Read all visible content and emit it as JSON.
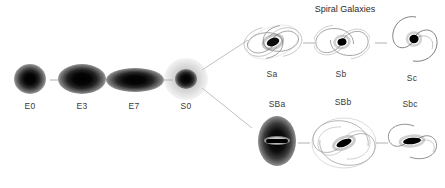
{
  "diagram": {
    "name": "Hubble Tuning Fork Diagram",
    "background_color": "#ffffff",
    "width": 445,
    "height": 188,
    "line_color": "#b4b4b4",
    "label_color": "#3a3a3a",
    "galaxy_color": "#000000"
  },
  "titles": {
    "spiral_branch": "Spiral Galaxies"
  },
  "ellipticals": {
    "sequence_label": "Elliptical sequence",
    "items": [
      {
        "label": "E0",
        "cx": 30,
        "cy": 79,
        "rx": 16,
        "ry": 15
      },
      {
        "label": "E3",
        "cx": 82,
        "cy": 79,
        "rx": 24,
        "ry": 15
      },
      {
        "label": "E7",
        "cx": 134,
        "cy": 80,
        "rx": 28,
        "ry": 12
      },
      {
        "label": "S0",
        "cx": 186,
        "cy": 78,
        "rx": 20,
        "ry": 19
      }
    ]
  },
  "spiral_branch": {
    "items": [
      {
        "label": "Sa",
        "cx": 272,
        "cy": 42
      },
      {
        "label": "Sb",
        "cx": 341,
        "cy": 42
      },
      {
        "label": "Sc",
        "cx": 412,
        "cy": 40
      }
    ]
  },
  "barred_branch": {
    "items": [
      {
        "label": "SBa",
        "cx": 277,
        "cy": 141
      },
      {
        "label": "SBb",
        "cx": 343,
        "cy": 143
      },
      {
        "label": "Sbc",
        "cx": 410,
        "cy": 139
      }
    ]
  },
  "connectors": {
    "fork_upper": "S0 to Sa branch line",
    "fork_lower": "S0 to SBa branch line",
    "dashes": [
      "E0-E3",
      "E3-E7",
      "E7-S0",
      "Sa-Sb",
      "Sb-Sc",
      "SBa-SBb",
      "SBb-Sbc"
    ]
  }
}
